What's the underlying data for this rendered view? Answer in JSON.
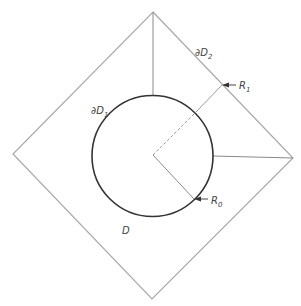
{
  "diagram": {
    "labels": {
      "outer_boundary": "∂D",
      "outer_boundary_sub": "2",
      "inner_boundary": "∂D",
      "inner_boundary_sub": "1",
      "r1": "R",
      "r1_sub": "1",
      "r0": "R",
      "r0_sub": "0",
      "domain": "D"
    },
    "colors": {
      "outer_line": "#a8a8a8",
      "circle": "#333333",
      "radius_line": "#9a9a9a",
      "text": "#444444"
    }
  }
}
